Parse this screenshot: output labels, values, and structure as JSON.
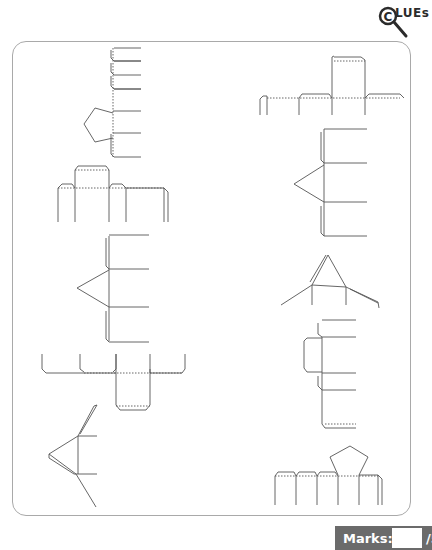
{
  "logo": {
    "text": "LUEs",
    "letter": "C",
    "icon": "magnifier-icon"
  },
  "worksheet": {
    "nets_count": 10,
    "nets": [
      {
        "id": 1,
        "description": "pentagonal prism net (vertical strip, pentagon on left)"
      },
      {
        "id": 2,
        "description": "rectangular strip net with top tabs"
      },
      {
        "id": 3,
        "description": "triangular prism net (vertical, triangle on left)"
      },
      {
        "id": 4,
        "description": "rectangular strip net with bottom flap"
      },
      {
        "id": 5,
        "description": "triangular pyramid-like net, angled"
      },
      {
        "id": 6,
        "description": "rectangular strip net with tall top face"
      },
      {
        "id": 7,
        "description": "triangular prism net (vertical, triangle on left)"
      },
      {
        "id": 8,
        "description": "triangle net with side flaps"
      },
      {
        "id": 9,
        "description": "cuboid net (vertical with side flap)"
      },
      {
        "id": 10,
        "description": "pentagonal prism net (horizontal strip, pentagon on top)"
      }
    ]
  },
  "marks": {
    "label": "Marks:",
    "value": "",
    "total": "/5"
  },
  "colors": {
    "frame": "#a9a9a9",
    "marks_bg": "#6b6b6b",
    "line": "#555555"
  }
}
